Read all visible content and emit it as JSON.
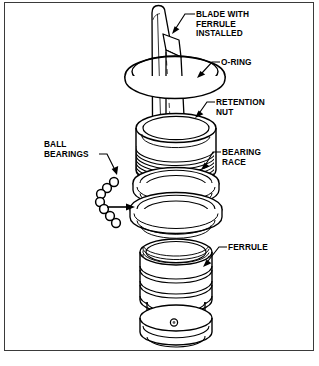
{
  "figure": {
    "type": "exploded-assembly-diagram",
    "caption": "",
    "line_color": "#000000",
    "fill_color": "#ffffff",
    "frame_color": "#3a3a3a",
    "background": "#ffffff"
  },
  "callouts": {
    "blade": {
      "line1": "BLADE WITH",
      "line2": "FERRULE",
      "line3": "INSTALLED"
    },
    "oring": {
      "line1": "O-RING"
    },
    "retention_nut": {
      "line1": "RETENTION",
      "line2": "NUT"
    },
    "bearing_race": {
      "line1": "BEARING",
      "line2": "RACE"
    },
    "ferrule": {
      "line1": "FERRULE"
    },
    "ball_bearings": {
      "line1": "BALL",
      "line2": "BEARINGS"
    }
  },
  "parts": {
    "order_top_to_bottom": [
      "blade with ferrule installed",
      "o-ring",
      "retention nut",
      "bearing race",
      "ball bearings",
      "ferrule"
    ],
    "ball_bearing_count": 7
  }
}
